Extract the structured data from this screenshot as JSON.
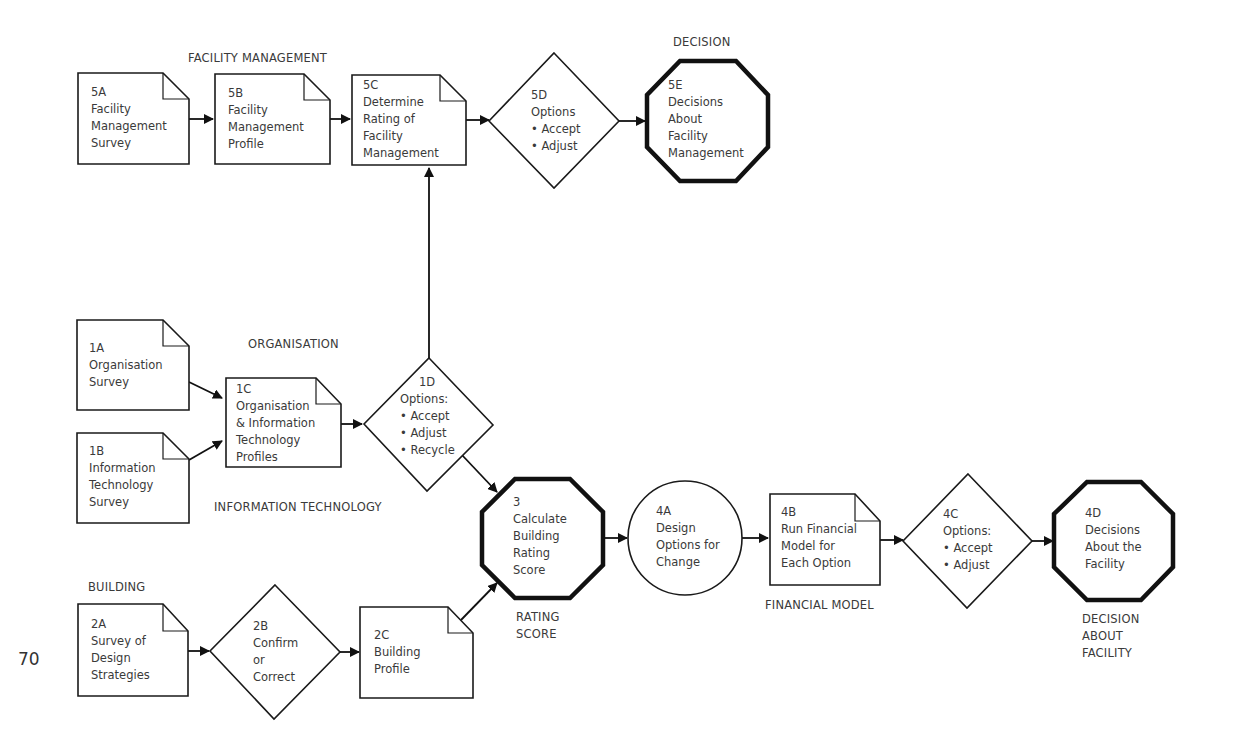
{
  "page_number": "70",
  "section_labels": {
    "facility_management": "FACILITY MANAGEMENT",
    "decision": "DECISION",
    "organisation": "ORGANISATION",
    "information_technology": "INFORMATION TECHNOLOGY",
    "building": "BUILDING",
    "rating_score_1": "RATING",
    "rating_score_2": "SCORE",
    "financial_model": "FINANCIAL MODEL",
    "decision_about_facility_1": "DECISION",
    "decision_about_facility_2": "ABOUT",
    "decision_about_facility_3": "FACILITY"
  },
  "nodes": {
    "n5A": {
      "shape": "document",
      "lines": [
        "5A",
        "Facility",
        "Management",
        "Survey"
      ]
    },
    "n5B": {
      "shape": "document",
      "lines": [
        "5B",
        "Facility",
        "Management",
        "Profile"
      ]
    },
    "n5C": {
      "shape": "document",
      "lines": [
        "5C",
        "Determine",
        "Rating of",
        "Facility",
        "Management"
      ]
    },
    "n5D": {
      "shape": "decision",
      "lines": [
        "5D",
        "Options",
        "• Accept",
        "• Adjust"
      ]
    },
    "n5E": {
      "shape": "octagon",
      "lines": [
        "5E",
        "Decisions",
        "About",
        "Facility",
        "Management"
      ]
    },
    "n1A": {
      "shape": "document",
      "lines": [
        "1A",
        "Organisation",
        "Survey"
      ]
    },
    "n1B": {
      "shape": "document",
      "lines": [
        "1B",
        "Information",
        "Technology",
        "Survey"
      ]
    },
    "n1C": {
      "shape": "document",
      "lines": [
        "1C",
        "Organisation",
        "& Information",
        "Technology",
        "Profiles"
      ]
    },
    "n1D": {
      "shape": "decision",
      "lines": [
        "1D",
        "Options:",
        "• Accept",
        "• Adjust",
        "• Recycle"
      ]
    },
    "n3": {
      "shape": "octagon",
      "lines": [
        "3",
        "Calculate",
        "Building",
        "Rating",
        "Score"
      ]
    },
    "n4A": {
      "shape": "circle",
      "lines": [
        "4A",
        "Design",
        "Options for",
        "Change"
      ]
    },
    "n4B": {
      "shape": "document",
      "lines": [
        "4B",
        "Run Financial",
        "Model for",
        "Each Option"
      ]
    },
    "n4C": {
      "shape": "decision",
      "lines": [
        "4C",
        "Options:",
        "• Accept",
        "• Adjust"
      ]
    },
    "n4D": {
      "shape": "octagon",
      "lines": [
        "4D",
        "Decisions",
        "About the",
        "Facility"
      ]
    },
    "n2A": {
      "shape": "document",
      "lines": [
        "2A",
        "Survey of",
        "Design",
        "Strategies"
      ]
    },
    "n2B": {
      "shape": "decision",
      "lines": [
        "2B",
        "Confirm",
        "or",
        "Correct"
      ]
    },
    "n2C": {
      "shape": "document",
      "lines": [
        "2C",
        "Building",
        "Profile"
      ]
    }
  },
  "edges": [
    [
      "5A",
      "5B"
    ],
    [
      "5B",
      "5C"
    ],
    [
      "5C",
      "5D"
    ],
    [
      "5D",
      "5E"
    ],
    [
      "1A",
      "1C"
    ],
    [
      "1B",
      "1C"
    ],
    [
      "1C",
      "1D"
    ],
    [
      "1D",
      "5C"
    ],
    [
      "1D",
      "3"
    ],
    [
      "2A",
      "2B"
    ],
    [
      "2B",
      "2C"
    ],
    [
      "2C",
      "3"
    ],
    [
      "3",
      "4A"
    ],
    [
      "4A",
      "4B"
    ],
    [
      "4B",
      "4C"
    ],
    [
      "4C",
      "4D"
    ]
  ]
}
